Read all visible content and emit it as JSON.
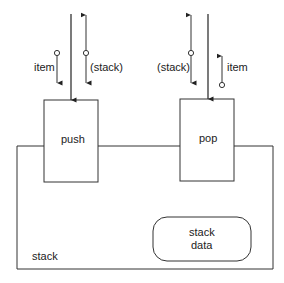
{
  "diagram": {
    "container": {
      "label": "stack"
    },
    "operations": [
      {
        "name": "push",
        "inputs": [
          {
            "label": "item",
            "direction": "in"
          },
          {
            "label": "(stack)",
            "direction": "in-out"
          }
        ]
      },
      {
        "name": "pop",
        "inputs": [
          {
            "label": "(stack)",
            "direction": "in-out"
          },
          {
            "label": "item",
            "direction": "out"
          }
        ]
      }
    ],
    "data_store": {
      "line1": "stack",
      "line2": "data"
    }
  }
}
